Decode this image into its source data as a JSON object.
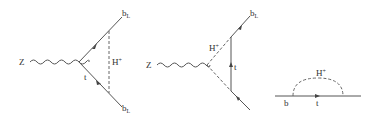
{
  "diagrams": [
    {
      "id": "vertex-scalar-exchange",
      "boson": "Z",
      "fermion_out_top": "b",
      "fermion_out_top_sub": "L",
      "fermion_out_bottom": "b",
      "fermion_out_bottom_sub": "L",
      "internal_fermion": "t",
      "internal_scalar": "H",
      "internal_scalar_sup": "+"
    },
    {
      "id": "vertex-fermion-exchange",
      "boson": "Z",
      "fermion_out_top": "b",
      "fermion_out_top_sub": "L",
      "internal_fermion": "t",
      "internal_scalar": "H",
      "internal_scalar_sup": "+"
    },
    {
      "id": "self-energy",
      "external_fermion": "b",
      "internal_fermion": "t",
      "internal_scalar": "H",
      "internal_scalar_sup": "+"
    }
  ],
  "colors": {
    "line": "#555555",
    "text": "#333333",
    "background": "#ffffff"
  }
}
